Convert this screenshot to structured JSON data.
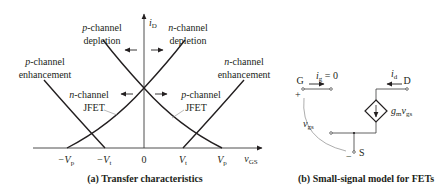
{
  "panel_a": {
    "caption": "(a)  Transfer characteristics",
    "y_axis_label": "i",
    "y_axis_sub": "D",
    "x_axis_label": "v",
    "x_axis_sub": "GS",
    "ticks": {
      "neg_vp": "−V",
      "neg_vp_sub": "p",
      "neg_vt": "−V",
      "neg_vt_sub": "t",
      "zero": "0",
      "vt": "V",
      "vt_sub": "t",
      "vp": "V",
      "vp_sub": "p"
    },
    "labels": {
      "p_depletion_1": "p",
      "p_depletion_2": "-channel",
      "p_depletion_3": "depletion",
      "n_depletion_1": "n",
      "n_depletion_2": "-channel",
      "n_depletion_3": "depletion",
      "p_enh_1": "p",
      "p_enh_2": "-channel",
      "p_enh_3": "enhancement",
      "n_enh_1": "n",
      "n_enh_2": "-channel",
      "n_enh_3": "enhancement",
      "n_jfet_1": "n",
      "n_jfet_2": "-channel",
      "n_jfet_3": "JFET",
      "p_jfet_1": "p",
      "p_jfet_2": "-channel",
      "p_jfet_3": "JFET"
    }
  },
  "panel_b": {
    "caption": "(b)  Small-signal model for FETs",
    "gate": "G",
    "drain": "D",
    "source": "S",
    "ig": "i",
    "ig_sub": "g",
    "ig_eq": " = 0",
    "id": "i",
    "id_sub": "d",
    "gm": "g",
    "gm_sub": "m",
    "v": "v",
    "v_sub": "gs",
    "vgs": "v",
    "vgs_sub": "gs",
    "plus": "+",
    "minus": "−"
  },
  "colors": {
    "ink": "#231f20",
    "axis": "#3a3a3a",
    "thin": "#8a8a8a"
  }
}
